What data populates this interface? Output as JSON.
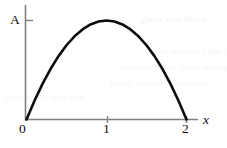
{
  "figure": {
    "name": "parabola-plot",
    "background_color": "#ffffff",
    "curve_color": "#0d0d0d",
    "axis_color": "#808080"
  },
  "labels": {
    "y_axis_value": "A",
    "x_axis_name": "x",
    "origin": "0",
    "tick_1": "1",
    "tick_2": "2"
  },
  "ghost_text": {
    "line1": "ghost text bleed",
    "line2": "faint reverse page text",
    "line3": "scanned paper show-through",
    "line4": "barely visible characters",
    "line5": "faint under text line"
  },
  "chart_data": {
    "type": "line",
    "title": "",
    "xlabel": "x",
    "ylabel": "A",
    "grid": false,
    "legend": null,
    "xlim": [
      0,
      2.15
    ],
    "ylim": [
      0,
      1.12
    ],
    "xticks": [
      0,
      1,
      2
    ],
    "xticklabels": [
      "0",
      "1",
      "2"
    ],
    "yticks": [
      1
    ],
    "yticklabels": [
      "A"
    ],
    "annotations": [
      {
        "text": "A",
        "x": 0,
        "y": 1,
        "note": "peak amplitude marked on y-axis"
      }
    ],
    "series": [
      {
        "name": "y = A x (2 - x)",
        "x": [
          0.0,
          0.1,
          0.2,
          0.3,
          0.4,
          0.5,
          0.6,
          0.7,
          0.8,
          0.9,
          1.0,
          1.1,
          1.2,
          1.3,
          1.4,
          1.5,
          1.6,
          1.7,
          1.8,
          1.9,
          2.0
        ],
        "values": [
          0.0,
          0.19,
          0.36,
          0.51,
          0.64,
          0.75,
          0.84,
          0.91,
          0.96,
          0.99,
          1.0,
          0.99,
          0.96,
          0.91,
          0.84,
          0.75,
          0.64,
          0.51,
          0.36,
          0.19,
          0.0
        ]
      }
    ]
  }
}
